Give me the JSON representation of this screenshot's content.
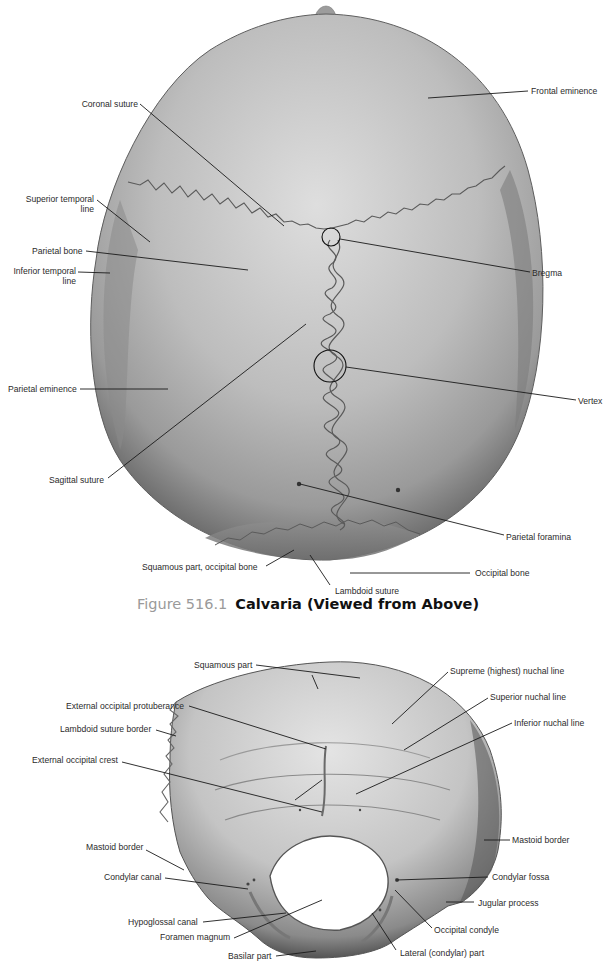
{
  "figure1": {
    "number": "Figure 516.1",
    "title": "Calvaria (Viewed from Above)",
    "labels": {
      "coronal_suture": "Coronal suture",
      "frontal_eminence": "Frontal eminence",
      "superior_temporal_line_1": "Superior temporal",
      "superior_temporal_line_2": "line",
      "parietal_bone": "Parietal bone",
      "bregma": "Bregma",
      "inferior_temporal_line_1": "Inferior temporal",
      "inferior_temporal_line_2": "line",
      "parietal_eminence": "Parietal eminence",
      "vertex": "Vertex",
      "sagittal_suture": "Sagittal suture",
      "parietal_foramina": "Parietal foramina",
      "squamous_part_occipital": "Squamous part, occipital bone",
      "occipital_bone": "Occipital bone",
      "lambdoid_suture": "Lambdoid suture"
    }
  },
  "figure2": {
    "labels": {
      "squamous_part": "Squamous part",
      "supreme_nuchal_line": "Supreme (highest) nuchal line",
      "external_occipital_protuberance": "External occipital protuberance",
      "superior_nuchal_line": "Superior nuchal line",
      "lambdoid_suture_border": "Lambdoid suture border",
      "inferior_nuchal_line": "Inferior nuchal line",
      "external_occipital_crest": "External occipital crest",
      "mastoid_border_left": "Mastoid border",
      "mastoid_border_right": "Mastoid border",
      "condylar_canal": "Condylar canal",
      "condylar_fossa": "Condylar fossa",
      "jugular_process": "Jugular process",
      "hypoglossal_canal": "Hypoglossal canal",
      "occipital_condyle": "Occipital condyle",
      "foramen_magnum": "Foramen magnum",
      "lateral_condylar_part": "Lateral (condylar) part",
      "basilar_part": "Basilar part"
    }
  },
  "colors": {
    "caption_number": "#9a9a9a",
    "caption_title": "#111111",
    "label_text": "#2b2b2b",
    "leader_line": "#1a1a1a",
    "bone_light": "#d9d9d9",
    "bone_mid": "#a8a8a8",
    "bone_dark": "#6a6a6a"
  }
}
